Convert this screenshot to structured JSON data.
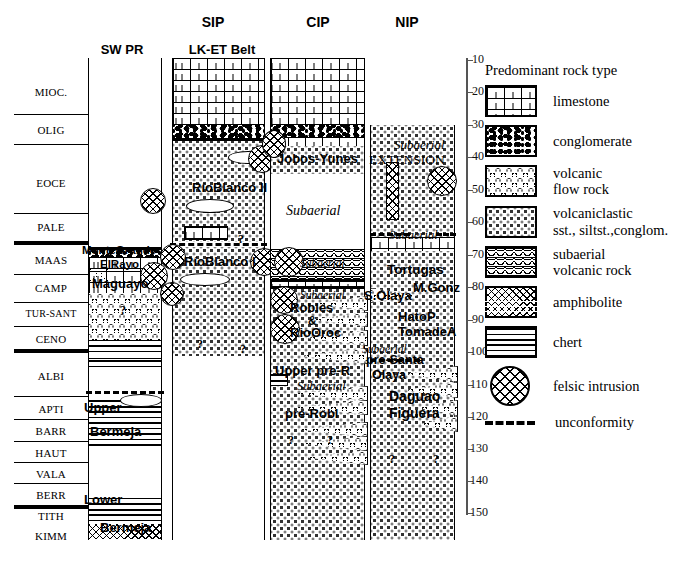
{
  "figure": {
    "type": "stratigraphic-correlation-chart",
    "title_visible": false
  },
  "headers": {
    "top_row": [
      {
        "label": "SIP",
        "x": 213
      },
      {
        "label": "CIP",
        "x": 318
      },
      {
        "label": "NIP",
        "x": 407
      }
    ],
    "second_row": [
      {
        "label": "SW PR",
        "x": 122
      },
      {
        "label": "LK-ET Belt",
        "x": 221
      }
    ]
  },
  "stage_column": {
    "name": "geologic-stage-column",
    "stages": [
      {
        "label": "MIOC.",
        "top": 58,
        "bottom": 114
      },
      {
        "label": "OLIG",
        "top": 114,
        "bottom": 144
      },
      {
        "label": "EOCE",
        "top": 144,
        "bottom": 213
      },
      {
        "label": "PALE",
        "top": 213,
        "bottom": 240
      },
      {
        "label": "MAAS",
        "top": 245,
        "bottom": 272
      },
      {
        "label": "CAMP",
        "top": 272,
        "bottom": 300
      },
      {
        "label": "TUR-SANT",
        "top": 300,
        "bottom": 326
      },
      {
        "label": "CENO",
        "top": 326,
        "bottom": 349
      },
      {
        "label": "ALBI",
        "top": 349,
        "bottom": 396
      },
      {
        "label": "APTI",
        "top": 396,
        "bottom": 419
      },
      {
        "label": "BARR",
        "top": 419,
        "bottom": 441
      },
      {
        "label": "HAUT",
        "top": 441,
        "bottom": 462
      },
      {
        "label": "VALA",
        "top": 462,
        "bottom": 483
      },
      {
        "label": "BERR",
        "top": 483,
        "bottom": 503
      },
      {
        "label": "TITH",
        "top": 503,
        "bottom": 521
      },
      {
        "label": "KIMM",
        "top": 521,
        "bottom": 545
      }
    ]
  },
  "time_axis": {
    "name": "age-axis-ma",
    "unit": "Ma",
    "ticks": [
      10,
      20,
      30,
      40,
      50,
      60,
      70,
      80,
      90,
      100,
      110,
      120,
      130,
      140,
      150
    ],
    "top_value": 10,
    "bottom_value": 150,
    "top_px": 60,
    "bottom_px": 513
  },
  "columns": [
    {
      "name": "sw-pr-column",
      "header": "SW PR",
      "units": [
        {
          "label": "MonteGrande",
          "style": "bold"
        },
        {
          "label": "ElRayo",
          "style": "bold"
        },
        {
          "label": "Maguayo",
          "style": "bold"
        },
        {
          "label": "Upper",
          "style": "bold"
        },
        {
          "label": "Bermeja",
          "style": "bold"
        },
        {
          "label": "Lower",
          "style": "bold"
        },
        {
          "label": "Bermeja",
          "style": "bold"
        }
      ],
      "question_marks": [
        "?"
      ]
    },
    {
      "name": "sip-lk-et-belt-column",
      "header": "LK-ET Belt",
      "group": "SIP",
      "units": [
        {
          "label": "RíoBlanco II",
          "style": "bold"
        },
        {
          "label": "RíoBlanco I",
          "style": "bold"
        }
      ],
      "question_marks": [
        "?",
        "?",
        "?"
      ]
    },
    {
      "name": "cip-column",
      "header": "CIP",
      "units": [
        {
          "label": "Jobos-Yunes",
          "style": "bold"
        },
        {
          "label": "Subaerial",
          "style": "italic"
        },
        {
          "label": "Subaerial",
          "style": "italic"
        },
        {
          "label": "Subaerial",
          "style": "italic"
        },
        {
          "label": "Robles",
          "style": "bold"
        },
        {
          "label": "&",
          "style": "bold"
        },
        {
          "label": "RioOroc",
          "style": "bold"
        },
        {
          "label": "Upper pre-R",
          "style": "bold"
        },
        {
          "label": "Subaerial",
          "style": "italic"
        },
        {
          "label": "pre-Robl",
          "style": "bold"
        }
      ],
      "question_marks": [
        "?",
        "?"
      ]
    },
    {
      "name": "nip-column",
      "header": "NIP",
      "units": [
        {
          "label": "Subaerial",
          "style": "italic"
        },
        {
          "label": "EXTENSION",
          "style": "plain"
        },
        {
          "label": "Subaerial",
          "style": "italic"
        },
        {
          "label": "Tortugas",
          "style": "bold"
        },
        {
          "label": "M.Gonz",
          "style": "bold"
        },
        {
          "label": "S.Olaya",
          "style": "bold"
        },
        {
          "label": "HatoP",
          "style": "bold"
        },
        {
          "label": "TomadeA",
          "style": "bold"
        },
        {
          "label": "Subaerial",
          "style": "italic"
        },
        {
          "label": "pre-Santa",
          "style": "bold"
        },
        {
          "label": "Olaya",
          "style": "bold"
        },
        {
          "label": "Daguao",
          "style": "bold"
        },
        {
          "label": "Figuera",
          "style": "bold"
        }
      ],
      "question_marks": [
        "?",
        "?"
      ]
    }
  ],
  "legend": {
    "title": "Predominant rock type",
    "items": [
      {
        "key": "limestone",
        "label": "limestone",
        "pattern": "brick"
      },
      {
        "key": "conglomerate",
        "label": "conglomerate",
        "pattern": "pebbles"
      },
      {
        "key": "volcflow",
        "label": "volcanic\nflow rock",
        "pattern": "chevrons",
        "line1": "volcanic",
        "line2": "flow rock"
      },
      {
        "key": "vclastic",
        "label": "volcaniclastic sst., siltst.,conglom.",
        "pattern": "stipple",
        "line1": "volcaniclastic",
        "line2": " sst., siltst.,conglom."
      },
      {
        "key": "subaerial",
        "label": "subaerial volcanic rock",
        "pattern": "arcs-lines",
        "line1": "subaerial",
        "line2": "volcanic rock"
      },
      {
        "key": "amphibolite",
        "label": "amphibolite",
        "pattern": "zigzag"
      },
      {
        "key": "chert",
        "label": "chert",
        "pattern": "horizontal-lines"
      },
      {
        "key": "felsic",
        "label": "felsic intrusion",
        "pattern": "cross-hatch-circle"
      },
      {
        "key": "unconformity",
        "label": "unconformity",
        "pattern": "thick-dashed-line"
      }
    ]
  },
  "colors": {
    "ink": "#000000",
    "axis": "#555555",
    "paper": "#ffffff"
  }
}
